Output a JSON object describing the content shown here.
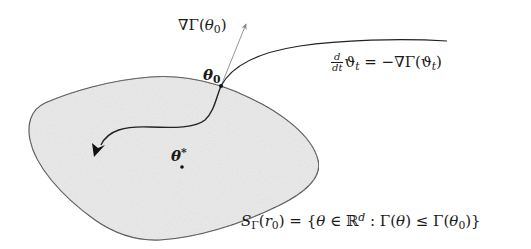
{
  "diagram": {
    "type": "gradient-flow-sublevel-set",
    "colors": {
      "background": "#ffffff",
      "region_fill": "#ececec",
      "outline": "#333333",
      "gradient_arrow": "#8a8a8a",
      "trajectory": "#222222"
    },
    "labels": {
      "gradient": {
        "nabla": "∇Γ(",
        "theta": "θ",
        "sub": "0",
        "close": ")"
      },
      "start_point": {
        "theta": "θ",
        "sub": "0"
      },
      "optimum": {
        "theta": "θ",
        "sup": "*"
      },
      "ode": {
        "frac_num": "d",
        "frac_den": "dt",
        "lhs_var": "ϑ",
        "lhs_sub": "t",
        "rhs": " = −∇Γ(",
        "rhs_var": "ϑ",
        "rhs_sub": "t",
        "rhs_close": ")"
      },
      "sublevel_set": {
        "S": "S",
        "S_sub": "Γ",
        "arg_open": "(",
        "r": "r",
        "r_sub": "0",
        "set_def_1": ") = {",
        "theta1": "θ",
        "in": " ∈ ℝ",
        "d": "d",
        "colon": " : Γ(",
        "theta2": "θ",
        "le": ") ≤ Γ(",
        "theta3": "θ",
        "theta3_sub": "0",
        "end": ")}"
      }
    },
    "points": {
      "theta0": {
        "x": 221,
        "y": 86
      },
      "theta_star": {
        "x": 182,
        "y": 167
      }
    }
  }
}
